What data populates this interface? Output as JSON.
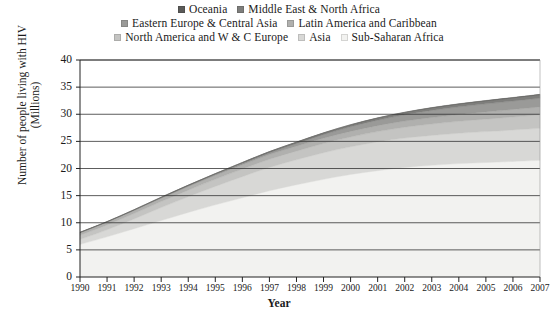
{
  "chart_data": {
    "type": "area",
    "stacked": true,
    "title": "",
    "xlabel": "Year",
    "ylabel": "Number of people living with HIV (Millions)",
    "ylabel_line1": "Number of people living with HIV",
    "ylabel_line2": "(Millions)",
    "x": [
      1990,
      1991,
      1992,
      1993,
      1994,
      1995,
      1996,
      1997,
      1998,
      1999,
      2000,
      2001,
      2002,
      2003,
      2004,
      2005,
      2006,
      2007
    ],
    "xlim": [
      1990,
      2007
    ],
    "ylim": [
      0,
      40
    ],
    "yticks": [
      0,
      5,
      10,
      15,
      20,
      25,
      30,
      35,
      40
    ],
    "xticks": [
      "1990",
      "1991",
      "1992",
      "1993",
      "1994",
      "1995",
      "1996",
      "1997",
      "1998",
      "1999",
      "2000",
      "2001",
      "2002",
      "2003",
      "2004",
      "2005",
      "2006",
      "2007"
    ],
    "grid": "horizontal",
    "legend_position": "top",
    "stack_order_bottom_to_top": [
      "Sub-Saharan Africa",
      "Asia",
      "North America and W & C Europe",
      "Latin America and Caribbean",
      "Eastern Europe & Central Asia",
      "Middle East & North Africa",
      "Oceania"
    ],
    "series": [
      {
        "name": "Sub-Saharan Africa",
        "color": "#f2f2f0",
        "values": [
          6.0,
          7.4,
          8.9,
          10.4,
          11.9,
          13.3,
          14.6,
          15.9,
          17.0,
          18.0,
          18.9,
          19.6,
          20.2,
          20.6,
          20.9,
          21.1,
          21.3,
          21.5
        ]
      },
      {
        "name": "Asia",
        "color": "#d8d8d6",
        "values": [
          0.9,
          1.3,
          1.8,
          2.4,
          2.9,
          3.4,
          3.9,
          4.3,
          4.6,
          4.9,
          5.1,
          5.3,
          5.4,
          5.5,
          5.6,
          5.7,
          5.8,
          5.9
        ]
      },
      {
        "name": "North America and W & C Europe",
        "color": "#c4c4c2",
        "values": [
          0.8,
          0.9,
          1.0,
          1.1,
          1.2,
          1.3,
          1.4,
          1.5,
          1.6,
          1.7,
          1.8,
          1.9,
          2.0,
          2.1,
          2.2,
          2.3,
          2.4,
          2.5
        ]
      },
      {
        "name": "Latin America and Caribbean",
        "color": "#b0b0ae",
        "values": [
          0.45,
          0.5,
          0.56,
          0.62,
          0.68,
          0.74,
          0.8,
          0.86,
          0.92,
          0.98,
          1.04,
          1.1,
          1.15,
          1.2,
          1.26,
          1.32,
          1.38,
          1.45
        ]
      },
      {
        "name": "Eastern Europe & Central Asia",
        "color": "#9a9a98",
        "values": [
          0.03,
          0.04,
          0.05,
          0.07,
          0.1,
          0.14,
          0.2,
          0.3,
          0.45,
          0.65,
          0.85,
          1.0,
          1.15,
          1.3,
          1.4,
          1.5,
          1.55,
          1.6
        ]
      },
      {
        "name": "Middle East & North Africa",
        "color": "#7e7e7c",
        "values": [
          0.05,
          0.07,
          0.09,
          0.11,
          0.14,
          0.17,
          0.2,
          0.24,
          0.28,
          0.32,
          0.36,
          0.4,
          0.44,
          0.48,
          0.52,
          0.56,
          0.6,
          0.65
        ]
      },
      {
        "name": "Oceania",
        "color": "#5a5a58",
        "values": [
          0.01,
          0.012,
          0.014,
          0.016,
          0.018,
          0.02,
          0.022,
          0.025,
          0.028,
          0.03,
          0.033,
          0.036,
          0.04,
          0.045,
          0.05,
          0.055,
          0.06,
          0.07
        ]
      }
    ],
    "totals": [
      8.24,
      10.22,
      12.4,
      14.71,
      16.93,
      19.05,
      21.12,
      23.08,
      24.85,
      26.55,
      28.07,
      29.34,
      30.34,
      31.23,
      31.88,
      32.54,
      33.07,
      33.67
    ]
  },
  "legend": {
    "rows": [
      [
        {
          "label": "Oceania",
          "color": "#5a5a58"
        },
        {
          "label": "Middle East & North Africa",
          "color": "#7e7e7c"
        }
      ],
      [
        {
          "label": "Eastern Europe & Central Asia",
          "color": "#9a9a98"
        },
        {
          "label": "Latin America and Caribbean",
          "color": "#b0b0ae"
        }
      ],
      [
        {
          "label": "North America and W & C Europe",
          "color": "#c4c4c2"
        },
        {
          "label": "Asia",
          "color": "#d8d8d6"
        },
        {
          "label": "Sub-Saharan Africa",
          "color": "#f2f2f0"
        }
      ]
    ]
  }
}
